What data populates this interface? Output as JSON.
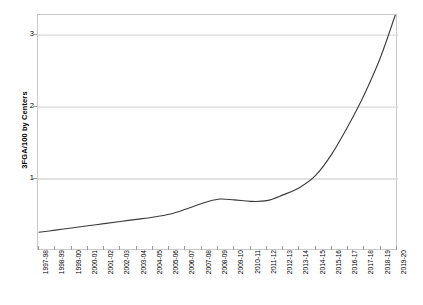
{
  "chart_data": {
    "type": "line",
    "title": "",
    "xlabel": "",
    "ylabel": "3FGA/100 by Centers",
    "ylim": [
      0,
      3.28
    ],
    "xlim_categories_count": 23,
    "grid": true,
    "grid_axis": "y",
    "legend": false,
    "legend_position": "none",
    "line_color": "#3a3a3a",
    "grid_color": "#d9d9d9",
    "frame_color": "#c9c9c9",
    "categories": [
      "1997-98",
      "1998-99",
      "1999-00",
      "2000-01",
      "2001-02",
      "2002-03",
      "2003-04",
      "2004-05",
      "2005-06",
      "2006-07",
      "2007-08",
      "2008-09",
      "2009-10",
      "2010-11",
      "2011-12",
      "2012-13",
      "2013-14",
      "2014-15",
      "2015-16",
      "2016-17",
      "2017-18",
      "2018-19",
      "2019-20"
    ],
    "series": [
      {
        "name": "3FGA/100 by Centers",
        "values": [
          0.26,
          0.29,
          0.32,
          0.35,
          0.38,
          0.41,
          0.44,
          0.47,
          0.51,
          0.58,
          0.66,
          0.72,
          0.71,
          0.69,
          0.7,
          0.78,
          0.88,
          1.05,
          1.35,
          1.74,
          2.18,
          2.7,
          3.35
        ]
      }
    ],
    "y_ticks": [
      1,
      2,
      3
    ],
    "y_tick_labels": [
      "1",
      "2",
      "3"
    ]
  },
  "axes": {
    "y_title": "3FGA/100 by Centers"
  }
}
